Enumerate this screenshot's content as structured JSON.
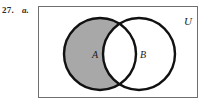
{
  "figure": {
    "exercise_number": "27.",
    "exercise_part": "a.",
    "universal_set_label": "U",
    "sets": [
      {
        "id": "A",
        "label": "A",
        "fill": "#a8a8a8",
        "shaded": true
      },
      {
        "id": "B",
        "label": "B",
        "fill": "#ffffff",
        "shaded": false
      }
    ],
    "overlap": {
      "label": "",
      "fill": "#ffffff",
      "shaded": false
    },
    "colors": {
      "shaded_region": "#a8a8a8",
      "unshaded_region": "#ffffff",
      "outline": "#111111",
      "rectangle_border": "#6f6f6f",
      "background": "#ffffff",
      "text": "#1a1a1a"
    },
    "geometry": {
      "rect": {
        "x": 38,
        "y": 6,
        "width": 160,
        "height": 92
      },
      "circle_a": {
        "cx": 100,
        "cy": 54,
        "r": 36
      },
      "circle_b": {
        "cx": 139,
        "cy": 54,
        "r": 36
      },
      "label_a": {
        "x": 95,
        "y": 57
      },
      "label_b": {
        "x": 143,
        "y": 57
      },
      "label_u": {
        "x": 188,
        "y": 25
      }
    }
  }
}
